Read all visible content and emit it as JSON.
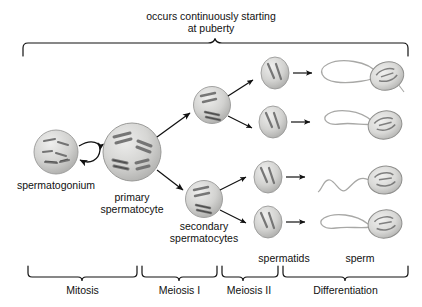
{
  "figure": {
    "top_caption_line1": "occurs continuously starting",
    "top_caption_line2": "at puberty"
  },
  "cells": {
    "spermatogonium": {
      "label": "spermatogonium"
    },
    "primary_spermatocyte": {
      "label_line1": "primary",
      "label_line2": "spermatocyte"
    },
    "secondary_spermatocytes": {
      "label_line1": "secondary",
      "label_line2": "spermatocytes"
    },
    "spermatids": {
      "label": "spermatids"
    },
    "sperm": {
      "label": "sperm"
    }
  },
  "phases": [
    {
      "label": "Mitosis"
    },
    {
      "label": "Meiosis I"
    },
    {
      "label": "Meiosis II"
    },
    {
      "label": "Differentiation"
    }
  ],
  "colors": {
    "ink": "#1a1a1a",
    "cell_fill": "#cfcfcf",
    "cell_edge": "#8a8a8a",
    "chromosome": "#6e6e6e",
    "background": "#ffffff"
  }
}
